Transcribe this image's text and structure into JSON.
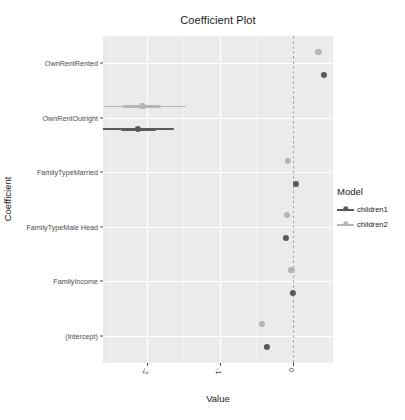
{
  "chart_data": {
    "type": "scatter",
    "title": "Coefficient Plot",
    "xlabel": "Value",
    "ylabel": "Coefficient",
    "xlim": [
      -2.6,
      0.55
    ],
    "xticks": [
      -2,
      -1,
      0
    ],
    "xtick_labels": [
      "-2",
      "-1",
      "0"
    ],
    "x_minor_ticks": [
      -2.5,
      -1.5,
      -0.5,
      0.5
    ],
    "grid": true,
    "grid_color": "#ffffff",
    "panel_color": "#ebebeb",
    "zero_line": 0,
    "zero_line_style": "dashed",
    "zero_line_color": "#a6a6a6",
    "legend_title": "Model",
    "legend_position": "right",
    "categories": [
      "OwnRentRented",
      "OwnRentOutright",
      "FamilyTypeMarried",
      "FamilyTypeMale Head",
      "FamilyIncome",
      "(Intercept)"
    ],
    "series": [
      {
        "name": "children1",
        "color": "#5a5a5a",
        "points": [
          {
            "coefficient": "OwnRentRented",
            "value": 0.42,
            "low": 0.4,
            "high": 0.44,
            "inner_low": 0.41,
            "inner_high": 0.43
          },
          {
            "coefficient": "OwnRentOutright",
            "value": -2.12,
            "low": -2.62,
            "high": -1.63,
            "inner_low": -2.36,
            "inner_high": -1.88
          },
          {
            "coefficient": "FamilyTypeMarried",
            "value": 0.04,
            "low": 0.02,
            "high": 0.06,
            "inner_low": 0.03,
            "inner_high": 0.05
          },
          {
            "coefficient": "FamilyTypeMale Head",
            "value": -0.1,
            "low": -0.12,
            "high": -0.08,
            "inner_low": -0.11,
            "inner_high": -0.09
          },
          {
            "coefficient": "FamilyIncome",
            "value": 0.0,
            "low": -0.02,
            "high": 0.02,
            "inner_low": -0.01,
            "inner_high": 0.01
          },
          {
            "coefficient": "(Intercept)",
            "value": -0.35,
            "low": -0.37,
            "high": -0.33,
            "inner_low": -0.36,
            "inner_high": -0.34
          }
        ]
      },
      {
        "name": "children2",
        "color": "#b5b5b5",
        "points": [
          {
            "coefficient": "OwnRentRented",
            "value": 0.35,
            "low": 0.33,
            "high": 0.37,
            "inner_low": 0.34,
            "inner_high": 0.36
          },
          {
            "coefficient": "OwnRentOutright",
            "value": -2.06,
            "low": -2.58,
            "high": -1.46,
            "inner_low": -2.32,
            "inner_high": -1.8
          },
          {
            "coefficient": "FamilyTypeMarried",
            "value": -0.07,
            "low": -0.09,
            "high": -0.05,
            "inner_low": -0.08,
            "inner_high": -0.06
          },
          {
            "coefficient": "FamilyTypeMale Head",
            "value": -0.08,
            "low": -0.12,
            "high": -0.04,
            "inner_low": -0.1,
            "inner_high": -0.06
          },
          {
            "coefficient": "FamilyIncome",
            "value": -0.02,
            "low": -0.04,
            "high": 0.0,
            "inner_low": -0.03,
            "inner_high": -0.01
          },
          {
            "coefficient": "(Intercept)",
            "value": -0.42,
            "low": -0.44,
            "high": -0.4,
            "inner_low": -0.43,
            "inner_high": -0.41
          }
        ]
      }
    ]
  }
}
